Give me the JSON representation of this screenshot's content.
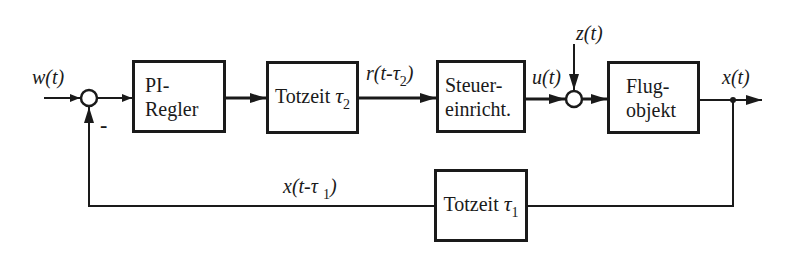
{
  "diagram": {
    "type": "control-loop-block-diagram",
    "blocks": {
      "pi_regler": {
        "lines": [
          "PI-",
          "Regler"
        ]
      },
      "totzeit2": {
        "text": "Totzeit",
        "symbol": "τ",
        "subscript": "2"
      },
      "steuer": {
        "lines": [
          "Steuer-",
          "einricht."
        ]
      },
      "flug": {
        "lines": [
          "Flug-",
          "objekt"
        ]
      },
      "totzeit1": {
        "text": "Totzeit",
        "symbol": "τ",
        "subscript": "1"
      }
    },
    "signals": {
      "w": "w(t)",
      "r_main": "r(t-τ",
      "r_sub": "2",
      "r_end": ")",
      "u": "u(t)",
      "z": "z(t)",
      "x": "x(t)",
      "xfb_main": "x(t-τ ",
      "xfb_sub": "1",
      "xfb_end": ")"
    },
    "summing_junctions": [
      {
        "id": "sum1",
        "signs": {
          "feedback": "-"
        }
      },
      {
        "id": "sum2",
        "signs": {}
      }
    ],
    "minus_sign": "-",
    "colors": {
      "line": "#1a1a1a",
      "background": "#ffffff"
    }
  }
}
